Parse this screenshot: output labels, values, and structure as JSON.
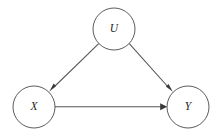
{
  "diagram": {
    "type": "causal-dag",
    "title": "",
    "background_color": "#ffffff",
    "node_stroke_color": "#4a4a4a",
    "edge_color": "#555555",
    "label_color": "#262626",
    "nodes": [
      {
        "id": "U",
        "label": "U",
        "cx": 114,
        "cy": 29,
        "r": 21
      },
      {
        "id": "X",
        "label": "X",
        "cx": 34,
        "cy": 107,
        "r": 21
      },
      {
        "id": "Y",
        "label": "Y",
        "cx": 188,
        "cy": 107,
        "r": 21
      }
    ],
    "edges": [
      {
        "id": "U-to-X",
        "from": "U",
        "to": "X",
        "label": "",
        "directed": true
      },
      {
        "id": "U-to-Y",
        "from": "U",
        "to": "Y",
        "label": "",
        "directed": true
      },
      {
        "id": "X-to-Y",
        "from": "X",
        "to": "Y",
        "label": "",
        "directed": true
      }
    ]
  }
}
